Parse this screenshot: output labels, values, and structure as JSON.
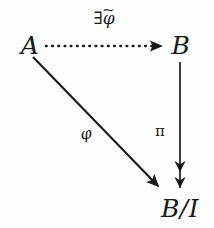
{
  "diagram": {
    "type": "commutative-diagram",
    "background_color": "#fdfdfd",
    "ink_color": "#1a1a1a",
    "nodes": [
      {
        "id": "A",
        "label": "A",
        "x": 30,
        "y": 45,
        "role": "source-object"
      },
      {
        "id": "B",
        "label": "B",
        "x": 181,
        "y": 45,
        "role": "target-object"
      },
      {
        "id": "B/I",
        "label": "B/I",
        "x": 180,
        "y": 208,
        "role": "quotient-object"
      }
    ],
    "arrows": [
      {
        "id": "a-to-b",
        "from": "A",
        "to": "B",
        "style": "dotted",
        "head": "single",
        "direction": "right",
        "label": "∃φ̃",
        "label_parts": {
          "quantifier": "∃",
          "map": "φ",
          "accent": "~"
        },
        "label_x": 104,
        "label_y": 18
      },
      {
        "id": "b-to-bi",
        "from": "B",
        "to": "B/I",
        "style": "solid",
        "head": "double",
        "direction": "down",
        "label": "π",
        "label_x": 160,
        "label_y": 131
      },
      {
        "id": "a-to-bi",
        "from": "A",
        "to": "B/I",
        "style": "solid",
        "head": "single",
        "direction": "diagonal-down-right",
        "label": "φ",
        "label_x": 86,
        "label_y": 134
      }
    ]
  }
}
